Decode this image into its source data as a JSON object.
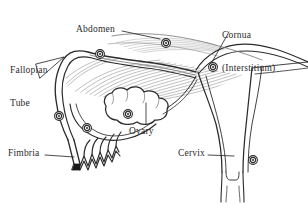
{
  "figure": {
    "kind": "anatomical-line-diagram",
    "background_color": "#ffffff",
    "ink_color": "#2b2b2b",
    "width": 308,
    "height": 204
  },
  "labels": {
    "fallopian_tube_line1": "Fallopian",
    "fallopian_tube_line2": "Tube",
    "abdomen": "Abdomen",
    "cornua_line1": "Cornua",
    "cornua_line2": "(Interstitium)",
    "ovary": "Ovary",
    "fimbria": "Fimbria",
    "cervix": "Cervix"
  },
  "markers": {
    "description": "small concentric-circle site markers",
    "count": 6,
    "names": [
      "marker-abdomen",
      "marker-tube-superior",
      "marker-cornua",
      "marker-tube-lateral",
      "marker-tube-inferior",
      "marker-ovary",
      "marker-cervix"
    ]
  },
  "leaders": {
    "abdomen": "horizontal line from label to abdominal wall marker",
    "cornua": "diagonal line from label down-left to cornual marker",
    "ovary": "vertical line from label up into ovary body",
    "fimbria": "horizontal line from label to fimbriated end",
    "cervix": "horizontal line from label to cervical marker",
    "fallopian_tube": "triangular wedge pointer from label to tube"
  }
}
